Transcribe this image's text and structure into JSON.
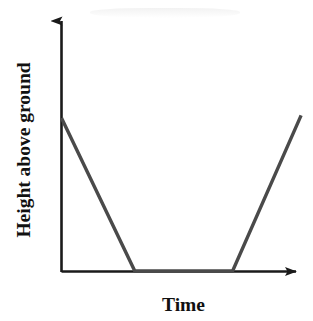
{
  "figure": {
    "background_color": "#ffffff",
    "axis_color": "#1a1a1a",
    "line_color": "#4a4a4a",
    "y_axis_label": "Height above ground",
    "x_axis_label": "Time",
    "y_arrow_icon": "arrow-up-icon",
    "x_arrow_icon": "arrow-right-icon"
  },
  "chart_data": {
    "type": "line",
    "title": "",
    "subtitle": "",
    "xlabel": "Time",
    "ylabel": "Height above ground",
    "xlim": [
      0,
      100
    ],
    "ylim": [
      0,
      100
    ],
    "grid": false,
    "legend": "none",
    "axis_ticks": "none",
    "axis_style": "arrow-headed axes, no tick marks, no numeric scale",
    "series": [
      {
        "name": "Height above ground",
        "x": [
          0,
          30,
          70,
          98
        ],
        "y": [
          62,
          0,
          0,
          63
        ],
        "description": "Object falls linearly from an initial height to the ground, remains on the ground for an interval, then rises linearly back up."
      }
    ],
    "segments": [
      {
        "name": "descent",
        "from": [
          0,
          62
        ],
        "to": [
          30,
          0
        ],
        "slope": "negative"
      },
      {
        "name": "on-ground",
        "from": [
          30,
          0
        ],
        "to": [
          70,
          0
        ],
        "slope": "zero"
      },
      {
        "name": "ascent",
        "from": [
          70,
          0
        ],
        "to": [
          98,
          63
        ],
        "slope": "positive"
      }
    ],
    "annotations": []
  }
}
